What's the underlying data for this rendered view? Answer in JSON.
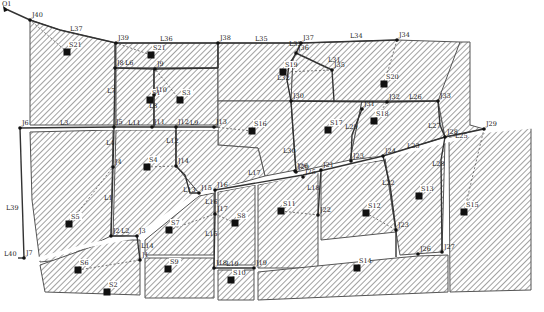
{
  "outfalls": [
    {
      "id": "O1"
    }
  ],
  "junctions": [
    {
      "id": "J40",
      "x": 30,
      "y": 20
    },
    {
      "id": "J39",
      "x": 116,
      "y": 43
    },
    {
      "id": "J38",
      "x": 218,
      "y": 43
    },
    {
      "id": "J37",
      "x": 301,
      "y": 43
    },
    {
      "id": "J34",
      "x": 397,
      "y": 40
    },
    {
      "id": "J36",
      "x": 296,
      "y": 53
    },
    {
      "id": "J35",
      "x": 332,
      "y": 70
    },
    {
      "id": "J8",
      "x": 115,
      "y": 68
    },
    {
      "id": "J9",
      "x": 155,
      "y": 69
    },
    {
      "id": "J10",
      "x": 154,
      "y": 95
    },
    {
      "id": "J30",
      "x": 291,
      "y": 101
    },
    {
      "id": "J32",
      "x": 387,
      "y": 102
    },
    {
      "id": "J33",
      "x": 438,
      "y": 101
    },
    {
      "id": "J31",
      "x": 362,
      "y": 109
    },
    {
      "id": "J6",
      "x": 20,
      "y": 128
    },
    {
      "id": "J5",
      "x": 114,
      "y": 127
    },
    {
      "id": "J11",
      "x": 152,
      "y": 127
    },
    {
      "id": "J12",
      "x": 176,
      "y": 127
    },
    {
      "id": "J13",
      "x": 214,
      "y": 127
    },
    {
      "id": "J4",
      "x": 113,
      "y": 167
    },
    {
      "id": "J14",
      "x": 176,
      "y": 166
    },
    {
      "id": "J28",
      "x": 445,
      "y": 137
    },
    {
      "id": "J29",
      "x": 484,
      "y": 129
    },
    {
      "id": "J23",
      "x": 351,
      "y": 161
    },
    {
      "id": "J24",
      "x": 383,
      "y": 156
    },
    {
      "id": "J25",
      "x": 303,
      "y": 177
    },
    {
      "id": "J26",
      "x": 295,
      "y": 171
    },
    {
      "id": "J21",
      "x": 321,
      "y": 170
    },
    {
      "id": "J20",
      "x": 296,
      "y": 172
    },
    {
      "id": "J15",
      "x": 199,
      "y": 193
    },
    {
      "id": "J16",
      "x": 215,
      "y": 190
    },
    {
      "id": "J17",
      "x": 215,
      "y": 214
    },
    {
      "id": "J22",
      "x": 318,
      "y": 215
    },
    {
      "id": "J2",
      "x": 111,
      "y": 236
    },
    {
      "id": "J3",
      "x": 137,
      "y": 236
    },
    {
      "id": "J1",
      "x": 140,
      "y": 260
    },
    {
      "id": "J7",
      "x": 24,
      "y": 258
    },
    {
      "id": "J18",
      "x": 214,
      "y": 268
    },
    {
      "id": "J19",
      "x": 254,
      "y": 268
    },
    {
      "id": "J23b",
      "x": 396,
      "y": 230
    },
    {
      "id": "J26b",
      "x": 418,
      "y": 254
    },
    {
      "id": "J27",
      "x": 442,
      "y": 252
    }
  ],
  "junction_labels": [
    {
      "id": "O1",
      "t": "O1"
    },
    {
      "id": "J40",
      "t": "J40"
    },
    {
      "id": "J39",
      "t": "J39"
    },
    {
      "id": "J38",
      "t": "J38"
    },
    {
      "id": "J37",
      "t": "J37"
    },
    {
      "id": "J34",
      "t": "J34"
    },
    {
      "id": "J36",
      "t": "J36"
    },
    {
      "id": "J35",
      "t": "J35"
    },
    {
      "id": "J8",
      "t": "J8"
    },
    {
      "id": "J9",
      "t": "J9"
    },
    {
      "id": "J10",
      "t": "J10"
    },
    {
      "id": "J30",
      "t": "J30"
    },
    {
      "id": "J32",
      "t": "J32"
    },
    {
      "id": "J33",
      "t": "J33"
    },
    {
      "id": "J31",
      "t": "J31"
    },
    {
      "id": "J6",
      "t": "J6"
    },
    {
      "id": "J5",
      "t": "J5"
    },
    {
      "id": "J11",
      "t": "J11"
    },
    {
      "id": "J12",
      "t": "J12"
    },
    {
      "id": "J13",
      "t": "J13"
    },
    {
      "id": "J4",
      "t": "J4"
    },
    {
      "id": "J14",
      "t": "J14"
    },
    {
      "id": "J28",
      "t": "J28"
    },
    {
      "id": "J29",
      "t": "J29"
    },
    {
      "id": "J24",
      "t": "J24"
    },
    {
      "id": "J25",
      "t": "J25"
    },
    {
      "id": "J26",
      "t": "J26"
    },
    {
      "id": "J21",
      "t": "J21"
    },
    {
      "id": "J20",
      "t": "J20"
    },
    {
      "id": "J15",
      "t": "J15"
    },
    {
      "id": "J16",
      "t": "J16"
    },
    {
      "id": "J17",
      "t": "J17"
    },
    {
      "id": "J22",
      "t": "J22"
    },
    {
      "id": "J2",
      "t": "J2"
    },
    {
      "id": "J3",
      "t": "J3"
    },
    {
      "id": "J1",
      "t": "J1"
    },
    {
      "id": "J7",
      "t": "J7"
    },
    {
      "id": "J18",
      "t": "J18"
    },
    {
      "id": "J19",
      "t": "J19"
    },
    {
      "id": "J23b",
      "t": "J23"
    },
    {
      "id": "J26b",
      "t": "J26"
    },
    {
      "id": "J27",
      "t": "J27"
    }
  ],
  "links": [
    "L1",
    "L2",
    "L3",
    "L4",
    "L5",
    "L6",
    "L7",
    "L8",
    "L9",
    "L10",
    "L11",
    "L12",
    "L13",
    "L14",
    "L15",
    "L16",
    "L17",
    "L18",
    "L19",
    "L20",
    "L21",
    "L22",
    "L23",
    "L24",
    "L25",
    "L26",
    "L27",
    "L28",
    "L29",
    "L30",
    "L31",
    "L32",
    "L33",
    "L34",
    "L35",
    "L36",
    "L37",
    "L38",
    "L39",
    "L40"
  ],
  "subcatchments": [
    {
      "id": "S1",
      "x": 150,
      "y": 100
    },
    {
      "id": "S2",
      "x": 107,
      "y": 292
    },
    {
      "id": "S3",
      "x": 180,
      "y": 100
    },
    {
      "id": "S4",
      "x": 147,
      "y": 167
    },
    {
      "id": "S5",
      "x": 69,
      "y": 224
    },
    {
      "id": "S6",
      "x": 78,
      "y": 270
    },
    {
      "id": "S7",
      "x": 169,
      "y": 230
    },
    {
      "id": "S8",
      "x": 235,
      "y": 223
    },
    {
      "id": "S9",
      "x": 168,
      "y": 269
    },
    {
      "id": "S10",
      "x": 231,
      "y": 280
    },
    {
      "id": "S11",
      "x": 281,
      "y": 211
    },
    {
      "id": "S12",
      "x": 366,
      "y": 213
    },
    {
      "id": "S13",
      "x": 419,
      "y": 196
    },
    {
      "id": "S14",
      "x": 357,
      "y": 268
    },
    {
      "id": "S15",
      "x": 464,
      "y": 212
    },
    {
      "id": "S16",
      "x": 252,
      "y": 131
    },
    {
      "id": "S17",
      "x": 328,
      "y": 130
    },
    {
      "id": "S18",
      "x": 374,
      "y": 121
    },
    {
      "id": "S19",
      "x": 283,
      "y": 72
    },
    {
      "id": "S20",
      "x": 384,
      "y": 84
    },
    {
      "id": "S21",
      "x": 67,
      "y": 52
    },
    {
      "id": "S21b",
      "x": 151,
      "y": 55
    }
  ],
  "subcatchment_labels": {
    "S1": "S1",
    "S2": "S2",
    "S3": "S3",
    "S4": "S4",
    "S5": "S5",
    "S6": "S6",
    "S7": "S7",
    "S8": "S8",
    "S9": "S9",
    "S10": "S10",
    "S11": "S11",
    "S12": "S12",
    "S13": "S13",
    "S14": "S14",
    "S15": "S15",
    "S16": "S16",
    "S17": "S17",
    "S18": "S18",
    "S19": "S19",
    "S20": "S20",
    "S21": "S21",
    "S21b": "S21"
  }
}
